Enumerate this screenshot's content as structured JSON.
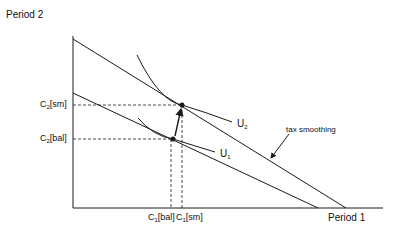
{
  "axes": {
    "y_title": "Period 2",
    "x_title": "Period 1"
  },
  "y_ticks": [
    {
      "base": "C",
      "sub": "2",
      "suffix": "[sm]"
    },
    {
      "base": "C",
      "sub": "2",
      "suffix": "[bal]"
    }
  ],
  "x_ticks": [
    {
      "base": "C",
      "sub": "1",
      "suffix": "[bal]"
    },
    {
      "base": "C",
      "sub": "1",
      "suffix": "[sm]"
    }
  ],
  "curves": {
    "u2": {
      "base": "U",
      "sub": "2"
    },
    "u1": {
      "base": "U",
      "sub": "1"
    }
  },
  "annotation": "tax smoothing",
  "colors": {
    "line": "#1a1a1a",
    "background": "#ffffff"
  }
}
